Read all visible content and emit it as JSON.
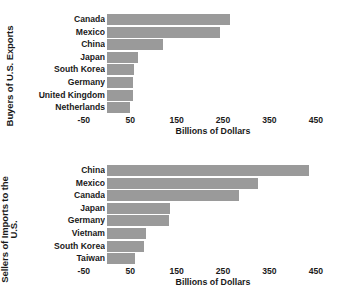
{
  "chart_data": [
    {
      "id": "exports",
      "type": "bar",
      "orientation": "horizontal",
      "title": "",
      "ylabel": "Buyers of U.S. Exports",
      "xlabel": "Billions of Dollars",
      "categories": [
        "Canada",
        "Mexico",
        "China",
        "Japan",
        "South Korea",
        "Germany",
        "United Kingdom",
        "Netherlands"
      ],
      "values": [
        265,
        243,
        120,
        67,
        58,
        57,
        55,
        50
      ],
      "xlim": [
        -50,
        470
      ],
      "xticks": [
        -50,
        50,
        150,
        250,
        350,
        450
      ],
      "xticklabels": [
        "-50",
        "50",
        "150",
        "250",
        "350",
        "450"
      ],
      "grid": false,
      "legend": "none",
      "bar_color": "#9a9a9a"
    },
    {
      "id": "imports",
      "type": "bar",
      "orientation": "horizontal",
      "title": "",
      "ylabel": "Sellers of Imports to the\nU.S.",
      "xlabel": "Billions of Dollars",
      "categories": [
        "China",
        "Mexico",
        "Canada",
        "Japan",
        "Germany",
        "Vietnam",
        "South Korea",
        "Taiwan"
      ],
      "values": [
        435,
        325,
        285,
        135,
        133,
        85,
        80,
        60
      ],
      "xlim": [
        -50,
        470
      ],
      "xticks": [
        -50,
        50,
        150,
        250,
        350,
        450
      ],
      "xticklabels": [
        "-50",
        "50",
        "150",
        "250",
        "350",
        "450"
      ],
      "grid": false,
      "legend": "none",
      "bar_color": "#9a9a9a"
    }
  ]
}
